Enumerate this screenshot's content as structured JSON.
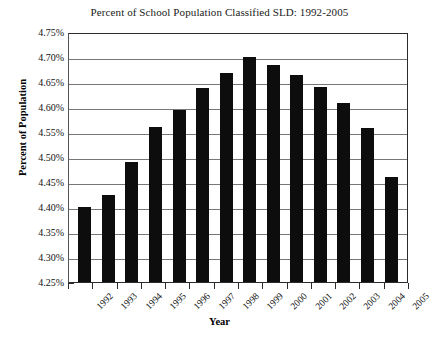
{
  "chart_data": {
    "type": "bar",
    "title": "Percent of School Population Classified SLD: 1992-2005",
    "xlabel": "Year",
    "ylabel": "Percent of Population",
    "categories": [
      "1992",
      "1993",
      "1994",
      "1995",
      "1996",
      "1997",
      "1998",
      "1999",
      "2000",
      "2001",
      "2002",
      "2003",
      "2004",
      "2005"
    ],
    "values": [
      4.4,
      4.425,
      4.49,
      4.56,
      4.593,
      4.638,
      4.668,
      4.7,
      4.685,
      4.663,
      4.64,
      4.608,
      4.558,
      4.46
    ],
    "value_suffix": "%",
    "ylim": [
      4.25,
      4.75
    ],
    "ytick_values": [
      4.75,
      4.7,
      4.65,
      4.6,
      4.55,
      4.5,
      4.45,
      4.4,
      4.35,
      4.3,
      4.25
    ],
    "ytick_labels": [
      "4.75%",
      "4.70%",
      "4.65%",
      "4.60%",
      "4.55%",
      "4.50%",
      "4.45%",
      "4.40%",
      "4.35%",
      "4.30%",
      "4.25%"
    ],
    "grid": true,
    "legend": null,
    "bar_color": "#0d0d0d",
    "gridline_color": "#777777",
    "axis_color": "#2b2b2b",
    "background_color": "#ffffff"
  }
}
